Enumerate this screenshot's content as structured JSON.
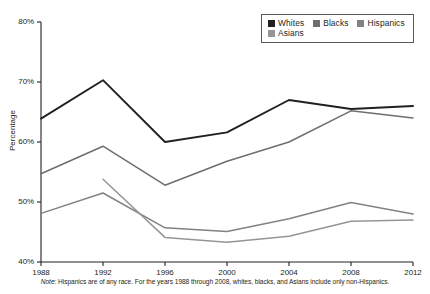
{
  "chart_data": {
    "type": "line",
    "title": "",
    "xlabel": "",
    "ylabel": "Percentage",
    "categories": [
      1988,
      1992,
      1996,
      2000,
      2004,
      2008,
      2012
    ],
    "x_tick_labels": [
      "1988",
      "1992",
      "1996",
      "2000",
      "2004",
      "2008",
      "2012"
    ],
    "y_tick_labels": [
      "80%",
      "70%",
      "60%",
      "50%",
      "40%"
    ],
    "y_tick_values": [
      80,
      70,
      60,
      50,
      40
    ],
    "ylim": [
      40,
      80
    ],
    "xlim": [
      1988,
      2012
    ],
    "grid": false,
    "legend_position": "top-right",
    "series": [
      {
        "name": "Whites",
        "color": "#231f20",
        "x": [
          1988,
          1992,
          1996,
          2000,
          2004,
          2008,
          2012
        ],
        "values": [
          63.9,
          70.3,
          60.0,
          61.6,
          67.0,
          65.5,
          66.0
        ]
      },
      {
        "name": "Blacks",
        "color": "#6d6e71",
        "x": [
          1988,
          1992,
          1996,
          2000,
          2004,
          2008,
          2012
        ],
        "values": [
          54.7,
          59.3,
          52.8,
          56.8,
          60.0,
          65.2,
          64.0
        ]
      },
      {
        "name": "Hispanics",
        "color": "#808285",
        "x": [
          1988,
          1992,
          1996,
          2000,
          2004,
          2008,
          2012
        ],
        "values": [
          48.1,
          51.5,
          45.7,
          45.1,
          47.2,
          49.9,
          48.0
        ]
      },
      {
        "name": "Asians",
        "color": "#939598",
        "x": [
          1992,
          1996,
          2000,
          2004,
          2008,
          2012
        ],
        "values": [
          53.8,
          44.1,
          43.3,
          44.3,
          46.8,
          47.0
        ]
      }
    ],
    "annotations": []
  },
  "legend": {
    "items": [
      {
        "label": "Whites",
        "color": "#231f20"
      },
      {
        "label": "Blacks",
        "color": "#6d6e71"
      },
      {
        "label": "Hispanics",
        "color": "#808285"
      },
      {
        "label": "Asians",
        "color": "#939598"
      }
    ]
  },
  "axes": {
    "y_title": "Percentage",
    "y_labels": [
      "80%",
      "70%",
      "60%",
      "50%",
      "40%"
    ],
    "x_labels": [
      "1988",
      "1992",
      "1996",
      "2000",
      "2004",
      "2008",
      "2012"
    ]
  },
  "footnote": {
    "note_word": "Note:",
    "text": " Hispanics are of any race. For the years 1988 through 2008, whites, blacks, and Asians include only non-Hispanics."
  },
  "colors": {
    "axis": "#231f20",
    "background": "#ffffff",
    "whites": "#231f20",
    "blacks": "#6d6e71",
    "hispanics": "#808285",
    "asians": "#939598"
  }
}
